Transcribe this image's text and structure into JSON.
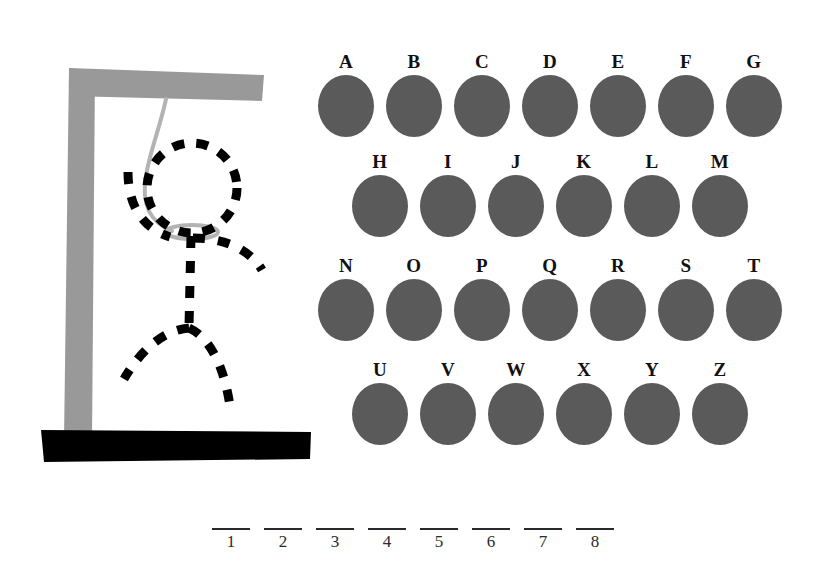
{
  "game": {
    "title": "Hangman",
    "background_color": "#ffffff"
  },
  "gallows": {
    "post_color": "#999999",
    "beam_color": "#999999",
    "base_color": "#000000",
    "rope_color": "#b3b3b3",
    "figure_color": "#000000",
    "parts": [
      {
        "name": "vertical-post",
        "label": "post"
      },
      {
        "name": "horizontal-beam",
        "label": "beam"
      },
      {
        "name": "ground-base",
        "label": "base"
      },
      {
        "name": "rope",
        "label": "rope"
      },
      {
        "name": "noose-loop",
        "label": "noose"
      }
    ]
  },
  "figure": {
    "style": "dashed",
    "color": "#000000",
    "parts": [
      {
        "name": "head",
        "label": "head"
      },
      {
        "name": "torso",
        "label": "torso"
      },
      {
        "name": "left-arm",
        "label": "left arm"
      },
      {
        "name": "right-arm",
        "label": "right arm"
      },
      {
        "name": "left-leg",
        "label": "left leg"
      },
      {
        "name": "right-leg",
        "label": "right leg"
      }
    ],
    "wrong_guesses": 6
  },
  "alphabet": {
    "disc_color": "#5a5a5a",
    "label_color": "#111111",
    "rows": [
      {
        "row_index": 0,
        "offset_x": 0,
        "offset_y": 0,
        "letters": [
          "A",
          "B",
          "C",
          "D",
          "E",
          "F",
          "G"
        ]
      },
      {
        "row_index": 1,
        "offset_x": 34,
        "offset_y": 100,
        "letters": [
          "H",
          "I",
          "J",
          "K",
          "L",
          "M"
        ]
      },
      {
        "row_index": 2,
        "offset_x": 0,
        "offset_y": 204,
        "letters": [
          "N",
          "O",
          "P",
          "Q",
          "R",
          "S",
          "T"
        ]
      },
      {
        "row_index": 3,
        "offset_x": 34,
        "offset_y": 308,
        "letters": [
          "U",
          "V",
          "W",
          "X",
          "Y",
          "Z"
        ]
      }
    ]
  },
  "answer": {
    "length": 8,
    "blanks": [
      {
        "index": 1,
        "number": "1",
        "letter": ""
      },
      {
        "index": 2,
        "number": "2",
        "letter": ""
      },
      {
        "index": 3,
        "number": "3",
        "letter": ""
      },
      {
        "index": 4,
        "number": "4",
        "letter": ""
      },
      {
        "index": 5,
        "number": "5",
        "letter": ""
      },
      {
        "index": 6,
        "number": "6",
        "letter": ""
      },
      {
        "index": 7,
        "number": "7",
        "letter": ""
      },
      {
        "index": 8,
        "number": "8",
        "letter": ""
      }
    ]
  }
}
